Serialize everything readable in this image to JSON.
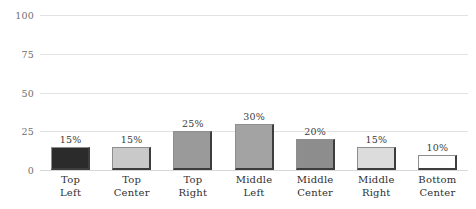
{
  "chart_data": {
    "type": "bar",
    "title": "",
    "subtitle": "",
    "xlabel": "",
    "ylabel": "",
    "ylim": [
      0,
      100
    ],
    "yticks": [
      0,
      25,
      50,
      75,
      100
    ],
    "ytick_labels": [
      "0",
      "25",
      "50",
      "75",
      "100"
    ],
    "grid": true,
    "legend": false,
    "legend_position": "none",
    "categories": [
      "Top Left",
      "Top Center",
      "Top Right",
      "Middle Left",
      "Middle Center",
      "Middle Right",
      "Bottom Center"
    ],
    "category_lines": [
      [
        "Top",
        "Left"
      ],
      [
        "Top",
        "Center"
      ],
      [
        "Top",
        "Right"
      ],
      [
        "Middle",
        "Left"
      ],
      [
        "Middle",
        "Center"
      ],
      [
        "Middle",
        "Right"
      ],
      [
        "Bottom",
        "Center"
      ]
    ],
    "values": [
      15,
      15,
      25,
      30,
      20,
      15,
      10
    ],
    "value_labels": [
      "15%",
      "15%",
      "25%",
      "30%",
      "20%",
      "15%",
      "10%"
    ],
    "bar_colors": [
      "#2b2b2b",
      "#c9c9c9",
      "#9a9a9a",
      "#a3a3a3",
      "#8d8d8d",
      "#dcdcdc",
      "#fdfdfd"
    ],
    "bar_border_color": "#8e8e8e",
    "bar_shadow_color": "#3d3d3d",
    "gridline_color": "#e2e2e2",
    "background_color": "#ffffff",
    "axis_text_color": "#6f6f6f",
    "label_text_color": "#2f2f2f"
  }
}
